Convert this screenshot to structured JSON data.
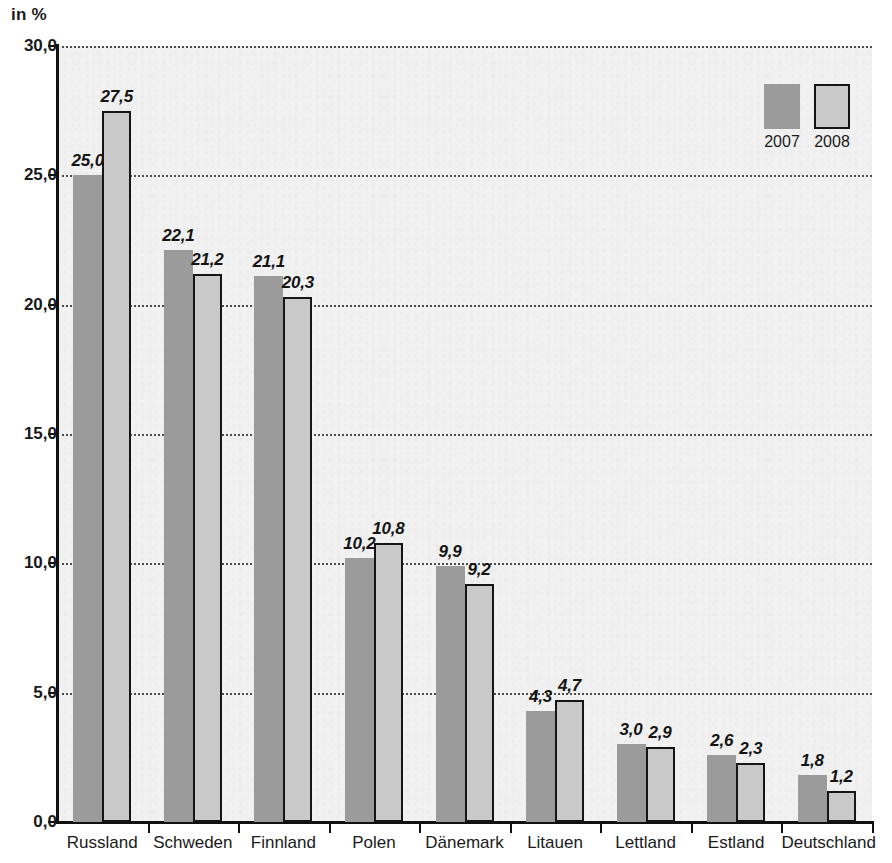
{
  "chart_data": {
    "type": "bar",
    "title": "",
    "subtitle": "",
    "unit_label": "in %",
    "xlabel": "",
    "ylabel": "",
    "ylim": [
      0,
      30
    ],
    "ytick_step": 5,
    "grid": true,
    "grid_style": "dotted-horizontal",
    "legend_position": "top-right",
    "categories": [
      "Russland",
      "Schweden",
      "Finnland",
      "Polen",
      "Dänemark",
      "Litauen",
      "Lettland",
      "Estland",
      "Deutschland"
    ],
    "ytick_labels": [
      "0,0",
      "5,0",
      "10,0",
      "15,0",
      "20,0",
      "25,0",
      "30,0"
    ],
    "ytick_values": [
      0,
      5,
      10,
      15,
      20,
      25,
      30
    ],
    "series": [
      {
        "name": "2007",
        "color": "#9b9b9b",
        "border": "none",
        "values": [
          25.0,
          22.1,
          21.1,
          10.2,
          9.9,
          4.3,
          3.0,
          2.6,
          1.8
        ],
        "labels": [
          "25,0",
          "22,1",
          "21,1",
          "10,2",
          "9,9",
          "4,3",
          "3,0",
          "2,6",
          "1,8"
        ]
      },
      {
        "name": "2008",
        "color": "#c9c9c9",
        "border": "#151515",
        "values": [
          27.5,
          21.2,
          20.3,
          10.8,
          9.2,
          4.7,
          2.9,
          2.3,
          1.2
        ],
        "labels": [
          "27,5",
          "21,2",
          "20,3",
          "10,8",
          "9,2",
          "4,7",
          "2,9",
          "2,3",
          "1,2"
        ]
      }
    ]
  },
  "legend": {
    "items": [
      {
        "label": "2007",
        "color": "#9b9b9b"
      },
      {
        "label": "2008",
        "color": "#c9c9c9"
      }
    ]
  },
  "colors": {
    "series_2007": "#9b9b9b",
    "series_2008": "#c9c9c9",
    "bar_border": "#151515",
    "axis": "#111111",
    "gridline": "#4d4d4d",
    "plot_background": "#f1f1f1",
    "page_background": "#ffffff",
    "text": "#1a1a1a"
  }
}
